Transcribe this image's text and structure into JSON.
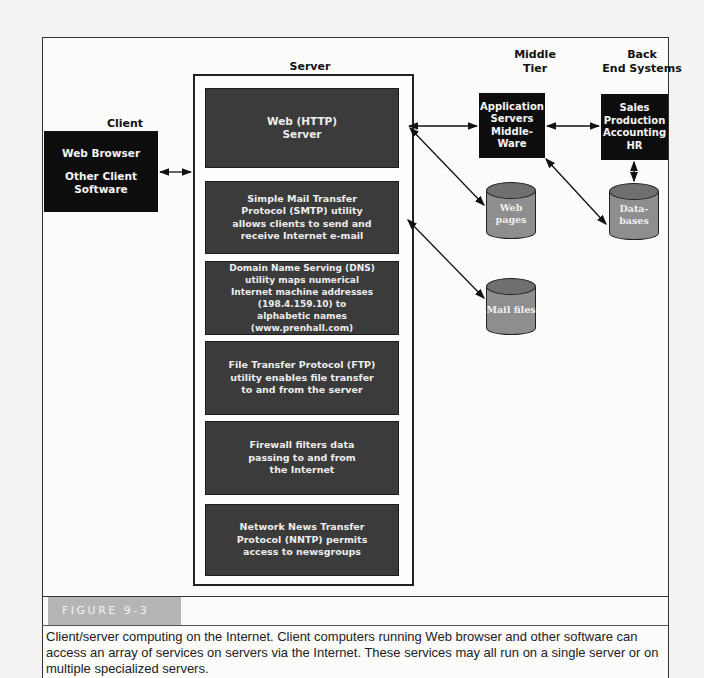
{
  "headers": {
    "client": "Client",
    "server": "Server",
    "middle_tier": [
      "Middle",
      "Tier"
    ],
    "back_end": [
      "Back",
      "End Systems"
    ]
  },
  "client_box": {
    "line1": "Web Browser",
    "line2": [
      "Other Client",
      "Software"
    ]
  },
  "server_services": [
    {
      "name": "web-http-server",
      "lines": [
        "Web (HTTP)",
        "Server"
      ]
    },
    {
      "name": "smtp-utility",
      "lines": [
        "Simple Mail Transfer",
        "Protocol (SMTP) utility",
        "allows clients to send and",
        "receive Internet e-mail"
      ]
    },
    {
      "name": "dns-utility",
      "lines": [
        "Domain Name Serving (DNS)",
        "utility maps numerical",
        "Internet machine addresses",
        "(198.4.159.10) to",
        "alphabetic names (www.prenhall.com)"
      ]
    },
    {
      "name": "ftp-utility",
      "lines": [
        "File Transfer Protocol (FTP)",
        "utility enables file transfer",
        "to and from the server"
      ]
    },
    {
      "name": "firewall",
      "lines": [
        "Firewall filters data",
        "passing to and from",
        "the Internet"
      ]
    },
    {
      "name": "nntp-utility",
      "lines": [
        "Network News Transfer",
        "Protocol (NNTP)  permits",
        "access to newsgroups"
      ]
    }
  ],
  "middle_tier_box": [
    "Application",
    "Servers",
    "Middle-",
    "Ware"
  ],
  "back_end_box": [
    "Sales",
    "Production",
    "Accounting",
    "HR"
  ],
  "databases": {
    "web_pages": [
      "Web",
      "pages"
    ],
    "data_bases": [
      "Data-",
      "bases"
    ],
    "mail_files": [
      "Mail files"
    ]
  },
  "figure": {
    "label": "FIGURE 9-3",
    "caption": "Client/server computing on the Internet. Client computers running Web browser and other software can access an array of services on servers via the Internet. These services may all run on a single server or on multiple specialized servers."
  },
  "colors": {
    "block_black": "#0d0d0d",
    "service_gray": "#3b3b3b",
    "cylinder_gray": "#8e8e8e",
    "figure_label_bg": "#b5b5b5"
  }
}
